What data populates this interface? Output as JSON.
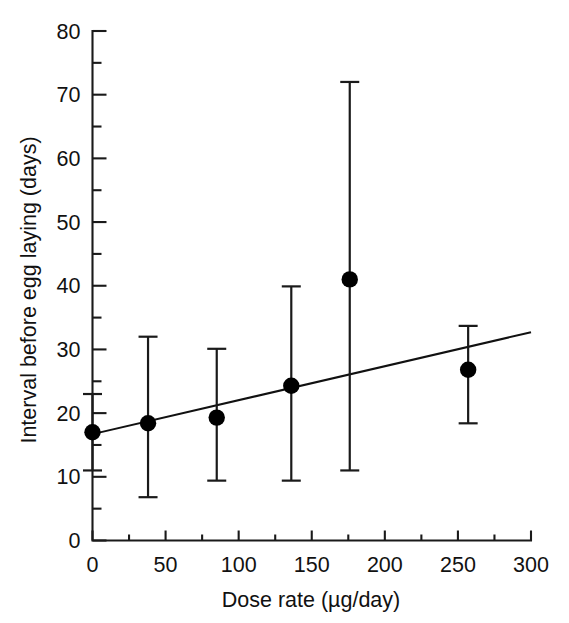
{
  "chart_data": {
    "type": "scatter",
    "title": "",
    "xlabel": "Dose rate (µg/day)",
    "ylabel": "Interval before egg laying (days)",
    "xlim": [
      0,
      300
    ],
    "ylim": [
      0,
      80
    ],
    "x_ticks": [
      0,
      50,
      100,
      150,
      200,
      250,
      300
    ],
    "x_tick_labels": [
      "0",
      "50",
      "100",
      "150",
      "200",
      "250",
      "300"
    ],
    "x_minor_step": 25,
    "y_ticks": [
      0,
      10,
      20,
      30,
      40,
      50,
      60,
      70,
      80
    ],
    "y_tick_labels": [
      "0",
      "10",
      "20",
      "30",
      "40",
      "50",
      "60",
      "70",
      "80"
    ],
    "y_minor_step": 5,
    "grid": false,
    "legend": "none",
    "series": [
      {
        "name": "Interval before egg laying",
        "marker": "filled-circle",
        "error_bars": "vertical",
        "points": [
          {
            "x": 0,
            "y": 17.0,
            "y_low": 11.0,
            "y_high": 23.0
          },
          {
            "x": 38,
            "y": 18.4,
            "y_low": 6.8,
            "y_high": 32.0
          },
          {
            "x": 85,
            "y": 19.3,
            "y_low": 9.4,
            "y_high": 30.1
          },
          {
            "x": 136,
            "y": 24.3,
            "y_low": 9.4,
            "y_high": 39.9
          },
          {
            "x": 176,
            "y": 41.0,
            "y_low": 11.0,
            "y_high": 72.0
          },
          {
            "x": 257,
            "y": 26.8,
            "y_low": 18.4,
            "y_high": 33.7
          }
        ]
      }
    ],
    "fit_line": {
      "name": "linear regression",
      "x_start": 0,
      "y_start": 16.7,
      "x_end": 300,
      "y_end": 32.7
    }
  }
}
